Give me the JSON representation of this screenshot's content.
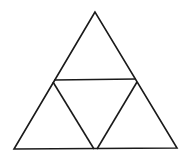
{
  "diagram": {
    "stroke_color": "#1a1a1a",
    "background": "#ffffff",
    "outer_triangle": {
      "apex": [
        95,
        12
      ],
      "left": [
        14,
        149
      ],
      "right": [
        177,
        148
      ]
    },
    "inner_lines": {
      "middle_horizontal": [
        [
          54,
          80
        ],
        [
          136,
          79
        ]
      ],
      "left_diagonal": [
        [
          54,
          80
        ],
        [
          94,
          149
        ]
      ],
      "right_diagonal": [
        [
          136,
          80
        ],
        [
          96,
          149
        ]
      ]
    }
  }
}
